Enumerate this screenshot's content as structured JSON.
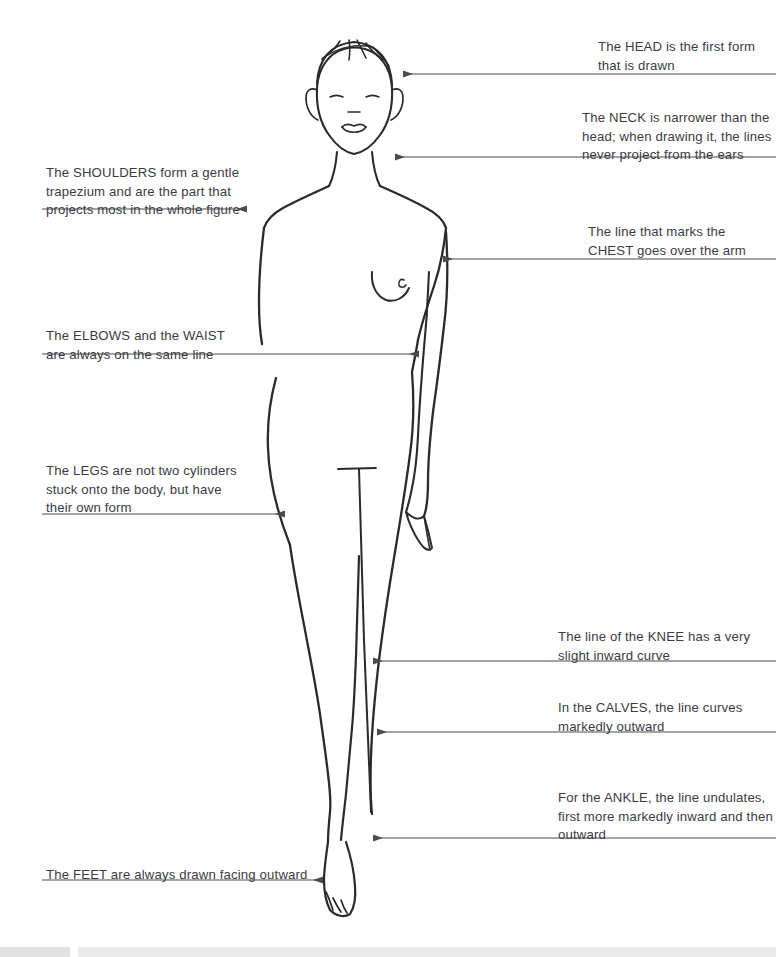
{
  "page": {
    "background_color": "#ffffff",
    "ink_color": "#2b2b2b",
    "text_color": "#3b3b42",
    "leader_color": "#4a4a52",
    "width": 776,
    "height": 957
  },
  "subject": {
    "name": "female-fashion-croquis-front-view",
    "description": "Line drawing of a standing female figure, front view, annotated with drawing-instruction callouts"
  },
  "annotations": [
    {
      "id": "head",
      "keyword": "HEAD",
      "side": "right",
      "text": "The HEAD is the first form\nthat is drawn",
      "text_x": 598,
      "text_y": 38,
      "text_width": 178,
      "line_y": 74,
      "line_from_x": 776,
      "line_to_x": 404
    },
    {
      "id": "neck",
      "keyword": "NECK",
      "side": "right",
      "text": "The NECK is narrower than the\nhead; when drawing it, the lines\nnever project from the ears",
      "text_x": 582,
      "text_y": 109,
      "text_width": 194,
      "line_y": 157,
      "line_from_x": 776,
      "line_to_x": 396
    },
    {
      "id": "shoulders",
      "keyword": "SHOULDERS",
      "side": "left",
      "text": "The SHOULDERS form a gentle\ntrapezium and are the part that\nprojects most in the whole figure",
      "text_x": 46,
      "text_y": 164,
      "text_width": 216,
      "line_y": 209,
      "line_from_x": 42,
      "line_to_x": 246
    },
    {
      "id": "chest",
      "keyword": "CHEST",
      "side": "right",
      "text": "The line that marks the\nCHEST goes over the arm",
      "text_x": 588,
      "text_y": 223,
      "text_width": 188,
      "line_y": 259,
      "line_from_x": 776,
      "line_to_x": 444
    },
    {
      "id": "elbows-waist",
      "keyword": "ELBOWS / WAIST",
      "side": "left",
      "text": "The ELBOWS and the WAIST\nare always on the same line",
      "text_x": 46,
      "text_y": 327,
      "text_width": 200,
      "line_y": 354,
      "line_from_x": 42,
      "line_to_x": 418
    },
    {
      "id": "legs",
      "keyword": "LEGS",
      "side": "left",
      "text": "The LEGS are not two cylinders\nstuck onto the body, but have\ntheir own form",
      "text_x": 46,
      "text_y": 462,
      "text_width": 216,
      "line_y": 514,
      "line_from_x": 42,
      "line_to_x": 284
    },
    {
      "id": "knee",
      "keyword": "KNEE",
      "side": "right",
      "text": "The line of the KNEE has a very\nslight inward curve",
      "text_x": 558,
      "text_y": 628,
      "text_width": 218,
      "line_y": 661,
      "line_from_x": 776,
      "line_to_x": 374
    },
    {
      "id": "calves",
      "keyword": "CALVES",
      "side": "right",
      "text": "In the CALVES, the line curves\nmarkedly outward",
      "text_x": 558,
      "text_y": 699,
      "text_width": 218,
      "line_y": 732,
      "line_from_x": 776,
      "line_to_x": 378
    },
    {
      "id": "ankle",
      "keyword": "ANKLE",
      "side": "right",
      "text": "For the ANKLE, the line undulates,\nfirst more markedly inward and then\noutward",
      "text_x": 558,
      "text_y": 789,
      "text_width": 218,
      "line_y": 838,
      "line_from_x": 776,
      "line_to_x": 374
    },
    {
      "id": "feet",
      "keyword": "FEET",
      "side": "left",
      "text": "The FEET are always drawn facing outward",
      "text_x": 46,
      "text_y": 866,
      "text_width": 260,
      "line_y": 880,
      "line_from_x": 42,
      "line_to_x": 322
    }
  ]
}
